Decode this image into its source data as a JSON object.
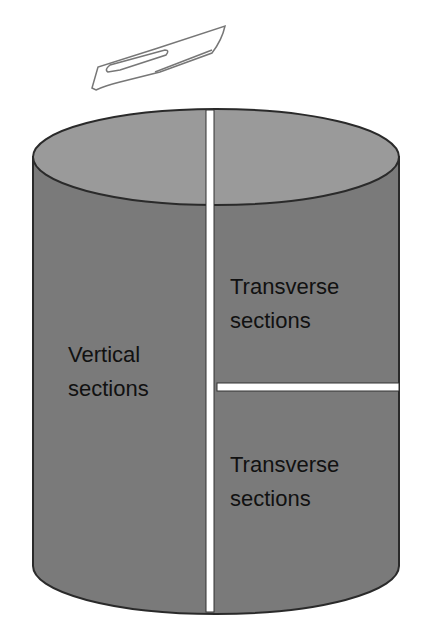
{
  "diagram": {
    "title": "",
    "labels": {
      "vertical": [
        "Vertical",
        "sections"
      ],
      "transverse_top": [
        "Transverse",
        "sections"
      ],
      "transverse_bottom": [
        "Transverse",
        "sections"
      ]
    },
    "icons": {
      "scalpel": "scalpel-icon"
    },
    "colors": {
      "cylinder_side": "#7a7a7a",
      "cylinder_top": "#9a9a9a",
      "outline": "#2a2a2a",
      "cut": "#ffffff"
    }
  }
}
